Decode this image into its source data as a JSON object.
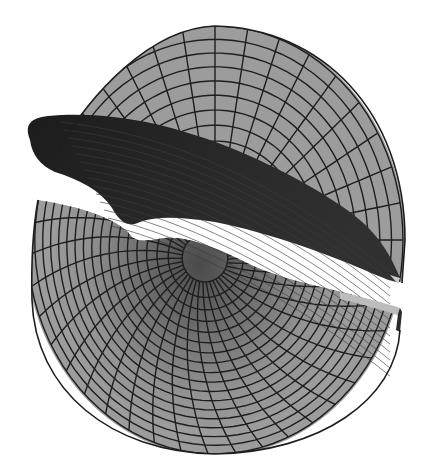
{
  "figure": {
    "type": "3d-surface-mesh",
    "colors": {
      "background": "#ffffff",
      "surface_light": "#9c9c9c",
      "surface_mid": "#7a7a7a",
      "surface_dark": "#2a2a2a",
      "grid_line": "#1e1e1e",
      "highlight_edge": "#c8c8c8"
    },
    "disk": {
      "cx": 215,
      "cy": 240,
      "rx": 188,
      "ry": 214
    },
    "grid": {
      "radial_divisions": 36,
      "ring_count": 11
    },
    "throat": {
      "cx": 205,
      "cy": 258,
      "r": 38
    }
  }
}
